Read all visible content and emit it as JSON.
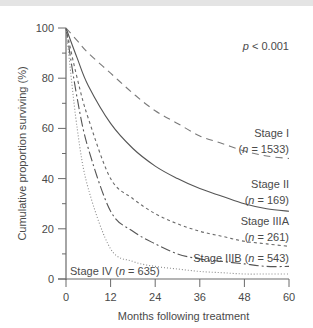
{
  "chart_data": {
    "type": "line",
    "title": "",
    "xlabel": "Months following treatment",
    "ylabel": "Cumulative proportion surviving (%)",
    "xlim": [
      0,
      60
    ],
    "ylim": [
      0,
      100
    ],
    "xticks": [
      0,
      12,
      24,
      36,
      48,
      60
    ],
    "yticks": [
      0,
      20,
      40,
      60,
      80,
      100
    ],
    "grid": false,
    "annotation": "p < 0.001",
    "x": [
      0,
      3,
      6,
      12,
      18,
      24,
      30,
      36,
      42,
      48,
      54,
      60
    ],
    "series": [
      {
        "name": "Stage I",
        "n": "1533",
        "style": "dashed",
        "values": [
          100,
          95,
          90,
          82,
          74,
          67,
          62,
          57,
          54,
          51,
          49,
          48
        ]
      },
      {
        "name": "Stage II",
        "n": "169",
        "style": "solid",
        "values": [
          100,
          88,
          77,
          62,
          52,
          45,
          40,
          36,
          33,
          30,
          28,
          27
        ]
      },
      {
        "name": "Stage IIIA",
        "n": "261",
        "style": "short-dashed",
        "values": [
          100,
          80,
          64,
          40,
          32,
          26,
          22,
          19,
          17,
          15,
          14,
          13
        ]
      },
      {
        "name": "Stage IIIB",
        "n": "543",
        "style": "dash-dot",
        "values": [
          100,
          72,
          52,
          27,
          19,
          14,
          10,
          8,
          7,
          6,
          5,
          5
        ]
      },
      {
        "name": "Stage IV",
        "n": "635",
        "style": "dotted",
        "values": [
          100,
          60,
          36,
          12,
          7,
          5,
          4,
          3,
          2.5,
          2,
          2,
          2
        ]
      }
    ],
    "labels": {
      "stage1_name": "Stage I",
      "stage1_n": "(n = 1533)",
      "stage2_name": "Stage II",
      "stage2_n": "(n = 169)",
      "stage3a_name": "Stage IIIA",
      "stage3a_n": "(n = 261)",
      "stage3b": "Stage IIIB (n = 543)",
      "stage4": "Stage IV (n = 635)"
    }
  }
}
